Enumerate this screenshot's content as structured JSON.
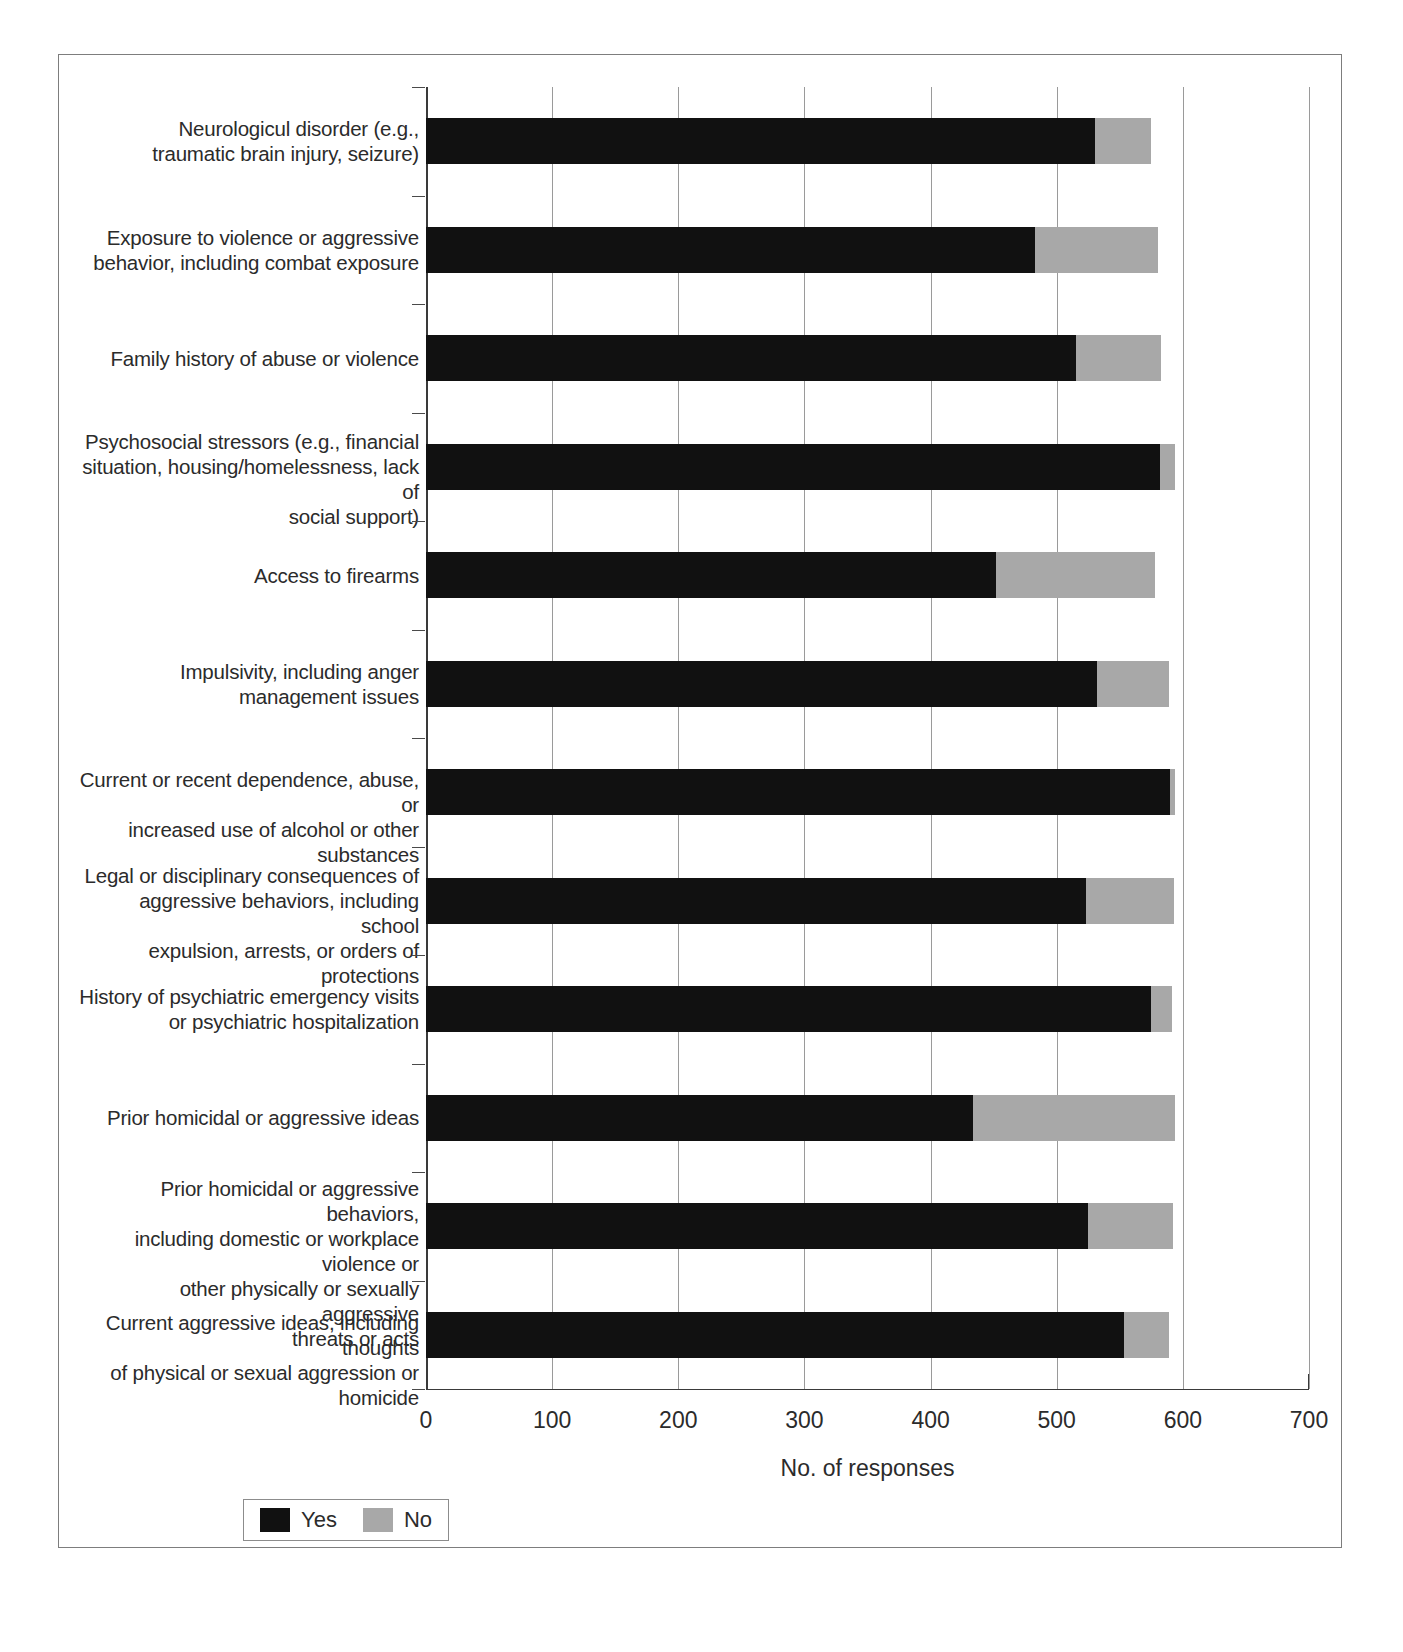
{
  "figure": {
    "legend": {
      "entries": [
        {
          "label": "Yes",
          "color": "#111111"
        },
        {
          "label": "No",
          "color": "#a8a8a8"
        }
      ]
    }
  },
  "chart_data": {
    "type": "bar",
    "orientation": "horizontal",
    "stacked": true,
    "title": "",
    "xlabel": "No. of responses",
    "ylabel": "",
    "xlim": [
      0,
      700
    ],
    "xticks": [
      0,
      100,
      200,
      300,
      400,
      500,
      600,
      700
    ],
    "xticklabels": [
      "0",
      "100",
      "200",
      "300",
      "400",
      "500",
      "600",
      "700"
    ],
    "grid": "vertical",
    "legend_position": "below-left",
    "categories": [
      "Neurologicul disorder (e.g., traumatic brain injury, seizure)",
      "Exposure to violence or aggressive behavior, including combat exposure",
      "Family history of abuse or violence",
      "Psychosocial stressors (e.g., financial situation, housing/homelessness, lack of social support)",
      "Access to firearms",
      "Impulsivity, including anger management issues",
      "Current or recent dependence, abuse, or increased use of alcohol or other substances",
      "Legal or disciplinary consequences of aggressive behaviors, including school expulsion, arrests, or orders of protections",
      "History of psychiatric emergency visits or psychiatric hospitalization",
      "Prior homicidal or aggressive ideas",
      "Prior homicidal or aggressive behaviors, including domestic or workplace violence or other physically or sexually aggressive threats or acts",
      "Current aggressive ideas, including thoughts of physical or sexual aggression or homicide"
    ],
    "category_lines": [
      [
        "Neurologicul disorder (e.g.,",
        "traumatic brain injury, seizure)"
      ],
      [
        "Exposure to violence or aggressive",
        "behavior, including combat exposure"
      ],
      [
        "Family history of abuse or violence"
      ],
      [
        "Psychosocial stressors (e.g., financial",
        "situation, housing/homelessness, lack of",
        "social support)"
      ],
      [
        "Access to firearms"
      ],
      [
        "Impulsivity, including anger",
        "management issues"
      ],
      [
        "Current or recent dependence, abuse, or",
        "increased use of alcohol or other substances"
      ],
      [
        "Legal or disciplinary consequences of",
        "aggressive behaviors, including school",
        "expulsion, arrests, or orders of protections"
      ],
      [
        "History of psychiatric emergency visits",
        "or psychiatric hospitalization"
      ],
      [
        "Prior homicidal or aggressive ideas"
      ],
      [
        "Prior homicidal or aggressive behaviors,",
        "including domestic or workplace violence or",
        "other physically or sexually aggressive",
        "threats or acts"
      ],
      [
        "Current aggressive ideas, including thoughts",
        "of physical or sexual aggression or homicide"
      ]
    ],
    "series": [
      {
        "name": "Yes",
        "color": "#111111",
        "values": [
          530,
          483,
          515,
          582,
          452,
          532,
          590,
          523,
          575,
          434,
          525,
          553
        ]
      },
      {
        "name": "No",
        "color": "#a8a8a8",
        "values": [
          45,
          97,
          68,
          12,
          126,
          57,
          4,
          70,
          16,
          160,
          67,
          36
        ]
      }
    ],
    "totals": [
      575,
      580,
      583,
      594,
      578,
      589,
      594,
      593,
      591,
      594,
      592,
      589
    ]
  }
}
